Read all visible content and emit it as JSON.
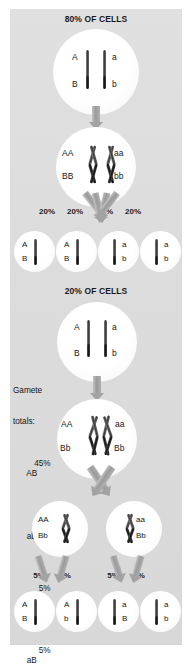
{
  "figure": {
    "type": "diagram"
  },
  "sections": [
    {
      "id": "top",
      "heading": "80% OF CELLS"
    },
    {
      "id": "bottom",
      "heading": "20% OF CELLS"
    }
  ],
  "top_section": {
    "heading": "80% OF CELLS",
    "parent_cell": {
      "left_top": "A",
      "left_bottom": "B",
      "right_top": "a",
      "right_bottom": "b"
    },
    "meiosis_cell": {
      "left_top": "AA",
      "left_bottom": "BB",
      "right_top": "aa",
      "right_bottom": "bb"
    },
    "percent_labels": [
      "20%",
      "20%",
      "20%",
      "20%"
    ],
    "gametes": [
      {
        "top": "A",
        "bottom": "B",
        "side": "left"
      },
      {
        "top": "A",
        "bottom": "B",
        "side": "left"
      },
      {
        "top": "a",
        "bottom": "b",
        "side": "right"
      },
      {
        "top": "a",
        "bottom": "b",
        "side": "right"
      }
    ]
  },
  "bottom_section": {
    "heading": "20% OF CELLS",
    "parent_cell": {
      "left_top": "A",
      "left_bottom": "B",
      "right_top": "a",
      "right_bottom": "b"
    },
    "crossover_cell": {
      "left_top": "AA",
      "left_bottom": "Bb",
      "right_top": "aa",
      "right_bottom": "Bb"
    },
    "daughter_cells": [
      {
        "top": "AA",
        "bottom": "Bb"
      },
      {
        "top": "aa",
        "bottom": "Bb"
      }
    ],
    "percent_labels": [
      "5%",
      "5%",
      "5%",
      "5%"
    ],
    "gametes": [
      {
        "top": "A",
        "bottom": "B",
        "side": "left"
      },
      {
        "top": "A",
        "bottom": "b",
        "side": "left"
      },
      {
        "top": "a",
        "bottom": "B",
        "side": "right"
      },
      {
        "top": "a",
        "bottom": "b",
        "side": "right"
      }
    ]
  },
  "gamete_totals": {
    "title_line1": "Gamete",
    "title_line2": "totals:",
    "rows": [
      {
        "percent": "45%",
        "genotype": "AB"
      },
      {
        "percent": "45%",
        "genotype": "ab"
      },
      {
        "percent": "5%",
        "genotype": "Ab"
      },
      {
        "percent": "5%",
        "genotype": "aB"
      }
    ]
  },
  "colors": {
    "panel_background": "#dcdcdc",
    "cell_fill": "#ffffff",
    "chromosome": "#232323",
    "arrow": "#a3a3a3",
    "text": "#161616"
  }
}
